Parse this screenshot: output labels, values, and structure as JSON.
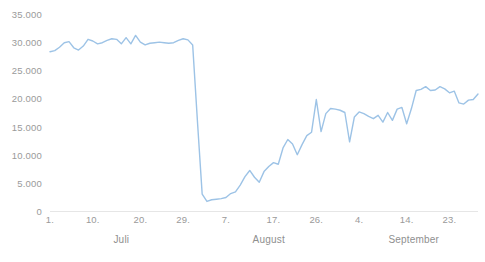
{
  "chart_data": {
    "type": "line",
    "title": "",
    "subtitle": "",
    "xlabel": "",
    "ylabel": "",
    "ylim": [
      0,
      35000
    ],
    "grid": false,
    "legend": "none",
    "line_color": "#9DC3E6",
    "y_ticks": [
      {
        "value": 35000,
        "label": "35.000"
      },
      {
        "value": 30000,
        "label": "30.000"
      },
      {
        "value": 25000,
        "label": "25.000"
      },
      {
        "value": 20000,
        "label": "20.000"
      },
      {
        "value": 15000,
        "label": "15.000"
      },
      {
        "value": 10000,
        "label": "10.000"
      },
      {
        "value": 5000,
        "label": "5.000"
      },
      {
        "value": 0,
        "label": "0"
      }
    ],
    "x_ticks": [
      {
        "index": 0,
        "label": "1."
      },
      {
        "index": 9,
        "label": "10."
      },
      {
        "index": 19,
        "label": "20."
      },
      {
        "index": 28,
        "label": "29."
      },
      {
        "index": 37,
        "label": "7."
      },
      {
        "index": 47,
        "label": "17."
      },
      {
        "index": 56,
        "label": "26."
      },
      {
        "index": 65,
        "label": "4."
      },
      {
        "index": 75,
        "label": "14."
      },
      {
        "index": 84,
        "label": "23."
      }
    ],
    "month_groups": [
      {
        "label": "Juli",
        "start_index": 0,
        "end_index": 30
      },
      {
        "label": "August",
        "start_index": 31,
        "end_index": 61
      },
      {
        "label": "September",
        "start_index": 62,
        "end_index": 91
      }
    ],
    "x": [
      "1.7",
      "2.7",
      "3.7",
      "4.7",
      "5.7",
      "6.7",
      "7.7",
      "8.7",
      "9.7",
      "10.7",
      "11.7",
      "12.7",
      "13.7",
      "14.7",
      "15.7",
      "16.7",
      "17.7",
      "18.7",
      "19.7",
      "20.7",
      "21.7",
      "22.7",
      "23.7",
      "24.7",
      "25.7",
      "26.7",
      "27.7",
      "28.7",
      "29.7",
      "30.7",
      "31.7",
      "1.8",
      "2.8",
      "3.8",
      "4.8",
      "5.8",
      "6.8",
      "7.8",
      "8.8",
      "9.8",
      "10.8",
      "11.8",
      "12.8",
      "13.8",
      "14.8",
      "15.8",
      "16.8",
      "17.8",
      "18.8",
      "19.8",
      "20.8",
      "21.8",
      "22.8",
      "23.8",
      "24.8",
      "25.8",
      "26.8",
      "27.8",
      "28.8",
      "29.8",
      "30.8",
      "31.8",
      "1.9",
      "2.9",
      "3.9",
      "4.9",
      "5.9",
      "6.9",
      "7.9",
      "8.9",
      "9.9",
      "10.9",
      "11.9",
      "12.9",
      "13.9",
      "14.9",
      "15.9",
      "16.9",
      "17.9",
      "18.9",
      "19.9",
      "20.9",
      "21.9",
      "22.9",
      "23.9",
      "24.9",
      "25.9",
      "26.9",
      "27.9",
      "28.9",
      "29.9"
    ],
    "values": [
      28300,
      28500,
      29100,
      29900,
      30100,
      29000,
      28600,
      29300,
      30500,
      30200,
      29700,
      29900,
      30300,
      30600,
      30500,
      29700,
      30800,
      29700,
      31200,
      30000,
      29500,
      29800,
      29900,
      30000,
      29900,
      29800,
      29900,
      30300,
      30600,
      30400,
      29500,
      16000,
      3000,
      1700,
      2000,
      2100,
      2200,
      2400,
      3100,
      3400,
      4600,
      6100,
      7200,
      6000,
      5100,
      7000,
      7900,
      8600,
      8300,
      11200,
      12700,
      11900,
      10000,
      11800,
      13400,
      14000,
      19800,
      14100,
      17300,
      18200,
      18100,
      17900,
      17500,
      12300,
      16700,
      17600,
      17300,
      16800,
      16400,
      17000,
      15800,
      17500,
      16100,
      18100,
      18400,
      15500,
      18200,
      21400,
      21600,
      22100,
      21400,
      21500,
      22100,
      21700,
      21000,
      21300,
      19200,
      19000,
      19700,
      19800,
      20800
    ]
  }
}
